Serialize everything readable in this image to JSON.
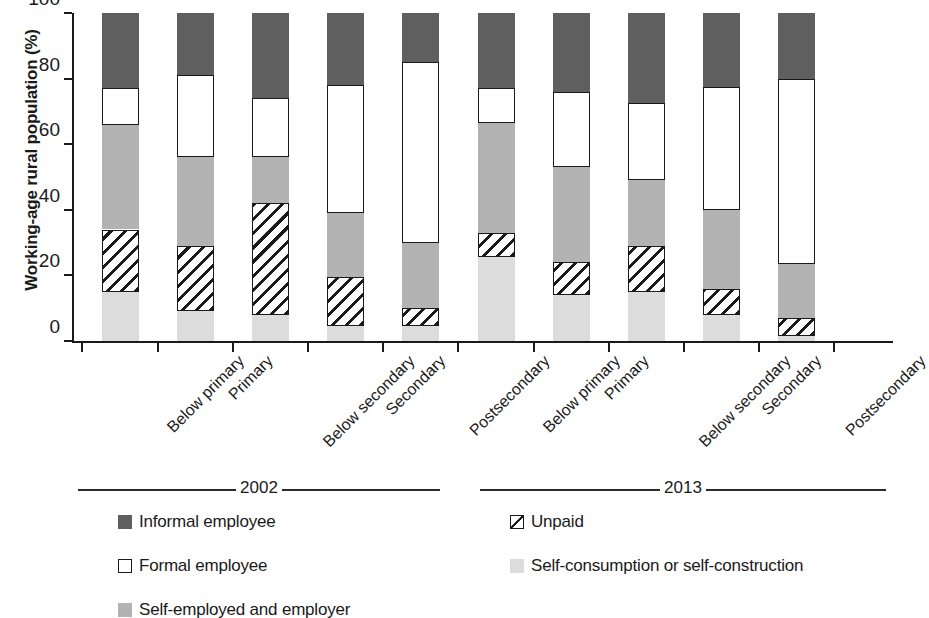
{
  "chart_data": {
    "type": "bar",
    "subtype": "stacked-bar-100",
    "title": "",
    "xlabel": "",
    "ylabel": "Working-age rural population (%)",
    "ylim": [
      0,
      100
    ],
    "yticks": [
      0,
      20,
      40,
      60,
      80,
      100
    ],
    "grid": false,
    "legend_position": "bottom",
    "groups": [
      {
        "label": "2002",
        "category_indices": [
          0,
          1,
          2,
          3,
          4
        ]
      },
      {
        "label": "2013",
        "category_indices": [
          5,
          6,
          7,
          8,
          9
        ]
      }
    ],
    "categories": [
      "Below primary",
      "Primary",
      "Below secondary",
      "Secondary",
      "Postsecondary",
      "Below primary",
      "Primary",
      "Below secondary",
      "Secondary",
      "Postsecondary"
    ],
    "series": [
      {
        "name": "Self-consumption or self-construction",
        "color": "#dcdcdc",
        "values": [
          15,
          9,
          8,
          4.5,
          4.5,
          25.5,
          14,
          15,
          8,
          1.5
        ]
      },
      {
        "name": "Unpaid",
        "color": "#ffffff",
        "pattern": "diagonal-hatch",
        "values": [
          19,
          20,
          34,
          15,
          5.5,
          7.5,
          10,
          14,
          8,
          5.5
        ]
      },
      {
        "name": "Self-employed and employer",
        "color": "#b3b3b3",
        "values": [
          32,
          27,
          14,
          19.5,
          20,
          33.5,
          29,
          20,
          24,
          16.5
        ]
      },
      {
        "name": "Formal employee",
        "color": "#ffffff",
        "values": [
          11,
          25,
          18,
          39,
          55,
          10.5,
          23,
          23.5,
          37.5,
          56.5
        ]
      },
      {
        "name": "Informal employee",
        "color": "#5f5f5f",
        "values": [
          23,
          19,
          26,
          22,
          15,
          23,
          24,
          27.5,
          22.5,
          20
        ]
      }
    ],
    "cumulative_tops": [
      [
        15,
        34,
        66,
        77,
        100
      ],
      [
        9,
        29,
        56,
        81,
        100
      ],
      [
        8,
        42,
        56,
        74,
        100
      ],
      [
        4.5,
        19.5,
        39,
        78,
        100
      ],
      [
        4.5,
        10,
        30,
        85,
        100
      ],
      [
        25.5,
        33,
        66.5,
        77,
        100
      ],
      [
        14,
        24,
        53,
        76,
        100
      ],
      [
        15,
        29,
        49,
        72.5,
        100
      ],
      [
        8,
        16,
        40,
        77.5,
        100
      ],
      [
        1.5,
        7,
        23.5,
        80,
        100
      ]
    ]
  },
  "axis": {
    "y_title": "Working-age rural population (%)",
    "y_tick_labels": [
      "100",
      "80",
      "60",
      "40",
      "20",
      "0"
    ]
  },
  "groups": {
    "left_label": "2002",
    "right_label": "2013"
  },
  "legend": {
    "items": [
      {
        "key": "informal",
        "label": "Informal employee",
        "swatch": "informal-swatch-icon"
      },
      {
        "key": "unpaid",
        "label": "Unpaid",
        "swatch": "unpaid-swatch-icon"
      },
      {
        "key": "formal",
        "label": "Formal employee",
        "swatch": "formal-swatch-icon"
      },
      {
        "key": "selfcons",
        "label": "Self-consumption or self-construction",
        "swatch": "self-consumption-swatch-icon"
      },
      {
        "key": "selfemp",
        "label": "Self-employed and employer",
        "swatch": "self-employed-swatch-icon"
      }
    ]
  },
  "colors": {
    "informal": "#5f5f5f",
    "formal": "#ffffff",
    "self_employed": "#b3b3b3",
    "self_consumption": "#dcdcdc",
    "unpaid_outline": "#1a1a1a",
    "axis": "#1a1a1a"
  }
}
